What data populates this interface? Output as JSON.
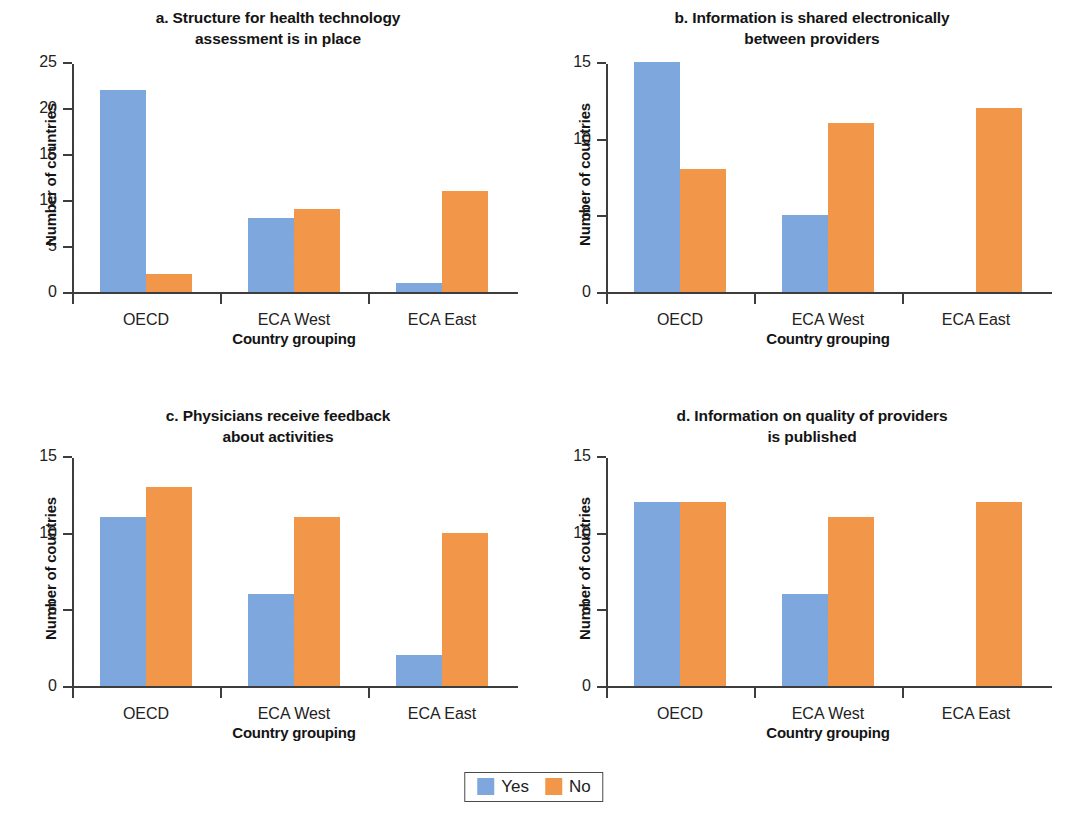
{
  "chart_data": [
    {
      "type": "bar",
      "panel": "a",
      "title": "a. Structure for health technology assessment is in place",
      "title_lines": [
        "a. Structure for health technology",
        "assessment is in place"
      ],
      "categories": [
        "OECD",
        "ECA West",
        "ECA East"
      ],
      "series": [
        {
          "name": "Yes",
          "color": "#7da7dd",
          "values": [
            22,
            8,
            1
          ]
        },
        {
          "name": "No",
          "color": "#f2974a",
          "values": [
            2,
            9,
            11
          ]
        }
      ],
      "xlabel": "Country grouping",
      "ylabel": "Number of countries",
      "ylim": [
        0,
        25
      ],
      "yticks": [
        0,
        5,
        10,
        15,
        20,
        25
      ],
      "grid": false
    },
    {
      "type": "bar",
      "panel": "b",
      "title": "b. Information is shared electronically between providers",
      "title_lines": [
        "b. Information is shared electronically",
        "between providers"
      ],
      "categories": [
        "OECD",
        "ECA West",
        "ECA East"
      ],
      "series": [
        {
          "name": "Yes",
          "color": "#7da7dd",
          "values": [
            15,
            5,
            0
          ]
        },
        {
          "name": "No",
          "color": "#f2974a",
          "values": [
            8,
            11,
            12
          ]
        }
      ],
      "xlabel": "Country grouping",
      "ylabel": "Number of countries",
      "ylim": [
        0,
        15
      ],
      "yticks": [
        0,
        5,
        10,
        15
      ],
      "grid": false
    },
    {
      "type": "bar",
      "panel": "c",
      "title": "c. Physicians receive feedback about activities",
      "title_lines": [
        "c. Physicians receive feedback",
        "about activities"
      ],
      "categories": [
        "OECD",
        "ECA West",
        "ECA East"
      ],
      "series": [
        {
          "name": "Yes",
          "color": "#7da7dd",
          "values": [
            11,
            6,
            2
          ]
        },
        {
          "name": "No",
          "color": "#f2974a",
          "values": [
            13,
            11,
            10
          ]
        }
      ],
      "xlabel": "Country grouping",
      "ylabel": "Number of countries",
      "ylim": [
        0,
        15
      ],
      "yticks": [
        0,
        5,
        10,
        15
      ],
      "grid": false
    },
    {
      "type": "bar",
      "panel": "d",
      "title": "d. Information on quality of providers is published",
      "title_lines": [
        "d. Information on quality of providers",
        "is published"
      ],
      "categories": [
        "OECD",
        "ECA West",
        "ECA East"
      ],
      "series": [
        {
          "name": "Yes",
          "color": "#7da7dd",
          "values": [
            12,
            6,
            0
          ]
        },
        {
          "name": "No",
          "color": "#f2974a",
          "values": [
            12,
            11,
            12
          ]
        }
      ],
      "xlabel": "Country grouping",
      "ylabel": "Number of countries",
      "ylim": [
        0,
        15
      ],
      "yticks": [
        0,
        5,
        10,
        15
      ],
      "grid": false
    }
  ],
  "legend": {
    "position": "bottom-center",
    "items": [
      {
        "label": "Yes",
        "color": "#7da7dd"
      },
      {
        "label": "No",
        "color": "#f2974a"
      }
    ]
  },
  "colors": {
    "yes": "#7da7dd",
    "no": "#f2974a",
    "axis": "#3d3d3d",
    "text": "#1a1a1a",
    "background": "#ffffff"
  }
}
